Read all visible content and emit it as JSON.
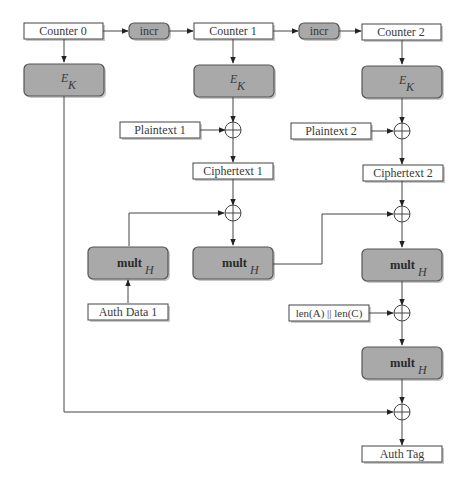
{
  "diagram": {
    "type": "GCM (Galois/Counter Mode) authenticated encryption flow",
    "counters": [
      "Counter 0",
      "Counter 1",
      "Counter 2"
    ],
    "incr": [
      "incr",
      "incr"
    ],
    "encrypt": {
      "main": "E",
      "sub": "K"
    },
    "plaintexts": [
      "Plaintext 1",
      "Plaintext 2"
    ],
    "ciphertexts": [
      "Ciphertext 1",
      "Ciphertext 2"
    ],
    "mult": {
      "main": "mult",
      "sub": "H"
    },
    "auth_data": "Auth Data 1",
    "length_block": "len(A) || len(C)",
    "auth_tag": "Auth Tag"
  }
}
